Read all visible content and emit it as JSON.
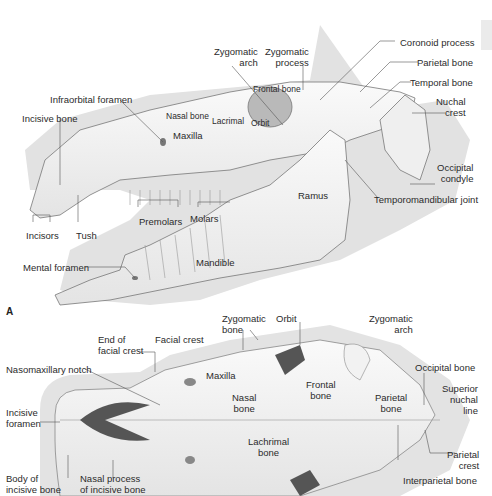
{
  "figure": {
    "panels": [
      "A"
    ],
    "lateral_view": {
      "labels": {
        "zygomatic_arch": "Zygomatic\narch",
        "zygomatic_process": "Zygomatic\nprocess",
        "coronoid_process": "Coronoid process",
        "parietal_bone": "Parietal bone",
        "temporal_bone": "Temporal bone",
        "nuchal_crest": "Nuchal\ncrest",
        "frontal_bone": "Frontal bone",
        "infraorbital_foramen": "Infraorbital foramen",
        "nasal_bone": "Nasal bone",
        "lacrimal": "Lacrimal",
        "orbit": "Orbit",
        "incisive_bone": "Incisive bone",
        "maxilla": "Maxilla",
        "occipital_condyle": "Occipital\ncondyle",
        "ramus": "Ramus",
        "temporomandibular_joint": "Temporomandibular joint",
        "premolars": "Premolars",
        "molars": "Molars",
        "incisors": "Incisors",
        "tush": "Tush",
        "mental_foramen": "Mental foramen",
        "mandible": "Mandible"
      }
    },
    "dorsal_view": {
      "labels": {
        "zygomatic_bone": "Zygomatic\nbone",
        "orbit": "Orbit",
        "zygomatic_arch": "Zygomatic\narch",
        "end_of_facial_crest": "End of\nfacial crest",
        "facial_crest": "Facial crest",
        "maxilla": "Maxilla",
        "nasomaxillary_notch": "Nasomaxillary notch",
        "nasal_bone": "Nasal\nbone",
        "frontal_bone": "Frontal\nbone",
        "parietal_bone": "Parietal\nbone",
        "occipital_bone": "Occipital bone",
        "superior_nuchal_line": "Superior\nnuchal\nline",
        "incisive_foramen": "Incisive\nforamen",
        "lachrimal_bone": "Lachrimal\nbone",
        "parietal_crest": "Parietal\ncrest",
        "interparietal_bone": "Interparietal bone",
        "body_of_incisive_bone": "Body of\nincisive bone",
        "nasal_process_of_incisive_bone": "Nasal process\nof incisive bone"
      }
    }
  }
}
